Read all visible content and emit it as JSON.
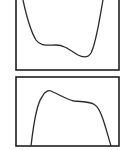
{
  "panels": [
    {
      "id": "top",
      "shape": "valley curve: descends steeply from top-left, shoulder plateau, minimum right of center, rises steeply to top-right",
      "box": {
        "x": 16,
        "y": -2,
        "w": 103,
        "h": 72
      },
      "path": "M23,0 C26,14 30,30 36,40 C40,46 46,45 56,45 C64,45 70,50 78,55 C84,58 88,58 91,53 C96,44 99,22 103,0"
    },
    {
      "id": "bottom",
      "shape": "hump curve: rises steeply from bottom-left to a peak, gentle dip to plateau, falls steeply to bottom-right",
      "box": {
        "x": 16,
        "y": 77,
        "w": 103,
        "h": 69
      },
      "path": "M31,146 C34,120 37,103 42,97 C45,91 49,89 53,92 C60,95 66,99 74,101 C82,102 90,101 95,105 C102,110 106,130 111,146"
    }
  ],
  "colors": {
    "stroke": "#2a2a2a",
    "background": "#ffffff"
  }
}
